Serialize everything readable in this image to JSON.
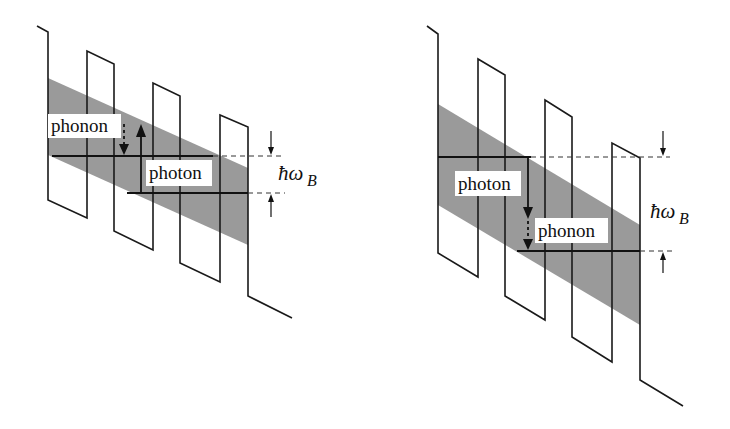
{
  "figure": {
    "panels": [
      {
        "id": "left",
        "description": "Upward transition: phonon absorbed then photon step between levels separated by hbar omega_B",
        "labels": {
          "phonon": "phonon",
          "photon": "photon",
          "energy_symbol": "ħω",
          "energy_subscript": "B"
        }
      },
      {
        "id": "right",
        "description": "Downward transition: photon emission followed by phonon relaxation across hbar omega_B",
        "labels": {
          "photon": "photon",
          "phonon": "phonon",
          "energy_symbol": "ħω",
          "energy_subscript": "B"
        }
      }
    ],
    "colors": {
      "band": "#9a9a9a",
      "lines": "#1a1a1a",
      "background": "#ffffff"
    }
  }
}
